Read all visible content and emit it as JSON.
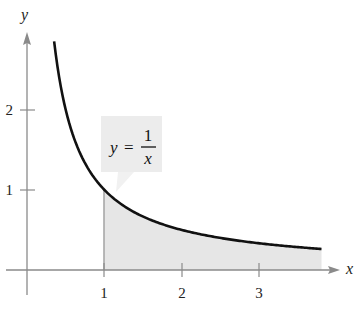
{
  "chart_data": {
    "type": "area",
    "title": "",
    "function": "y = 1/x",
    "xlabel": "x",
    "ylabel": "y",
    "x_ticks": [
      1,
      2,
      3
    ],
    "y_ticks": [
      1,
      2
    ],
    "xlim": [
      0,
      4.1
    ],
    "ylim": [
      0,
      3.0
    ],
    "grid": false,
    "curve": {
      "x_start": 0.35,
      "x_end": 3.8,
      "points": [
        {
          "x": 0.35,
          "y": 2.86
        },
        {
          "x": 0.5,
          "y": 2.0
        },
        {
          "x": 0.75,
          "y": 1.33
        },
        {
          "x": 1.0,
          "y": 1.0
        },
        {
          "x": 1.5,
          "y": 0.67
        },
        {
          "x": 2.0,
          "y": 0.5
        },
        {
          "x": 2.5,
          "y": 0.4
        },
        {
          "x": 3.0,
          "y": 0.33
        },
        {
          "x": 3.5,
          "y": 0.29
        },
        {
          "x": 3.8,
          "y": 0.26
        }
      ]
    },
    "shaded_region": {
      "from_x": 1,
      "to_x": 3.8,
      "under": "y = 1/x",
      "color": "#e4e4e4"
    },
    "annotation": {
      "lhs": "y",
      "equals": "=",
      "numerator": "1",
      "denominator": "x",
      "box_color": "#ececec"
    }
  },
  "colors": {
    "curve": "#111111",
    "axis": "#888888",
    "shade": "#e6e6e6",
    "label_box": "#ececec"
  },
  "labels": {
    "x_axis": "x",
    "y_axis": "y",
    "x_ticks": [
      "1",
      "2",
      "3"
    ],
    "y_ticks": [
      "1",
      "2"
    ],
    "eq_lhs": "y",
    "eq_equals": "=",
    "eq_num": "1",
    "eq_den": "x"
  }
}
